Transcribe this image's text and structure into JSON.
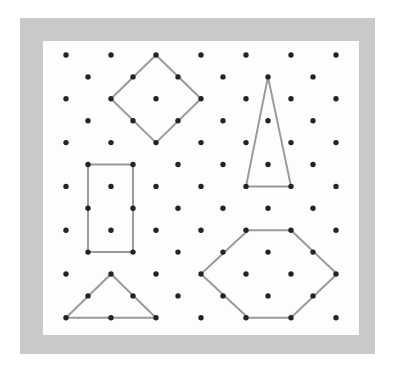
{
  "figure": {
    "kind": "geoboard-dot-grid",
    "canvas": {
      "width": 394,
      "height": 373,
      "background": "#ffffff"
    },
    "frame": {
      "name": "gray-border-frame",
      "x": 20,
      "y": 18,
      "width": 355,
      "height": 336,
      "color": "#c9c9c9"
    },
    "board": {
      "name": "white-dot-field",
      "x": 43,
      "y": 41,
      "width": 316,
      "height": 294,
      "color": "#fdfdfd"
    },
    "colors": {
      "dot": "#242424",
      "stroke": "#9a9a9a",
      "frame": "#c9c9c9",
      "board": "#fdfdfd",
      "page": "#ffffff"
    },
    "grid": {
      "pattern": "staggered-offset-rows",
      "row_count": 13,
      "odd_row_dot_count": 7,
      "even_row_dot_count": 6,
      "x_spacing": 45,
      "y_spacing": 21.9,
      "odd_row_x": [
        66,
        111,
        156,
        201,
        246,
        291,
        336
      ],
      "even_row_x": [
        88,
        133,
        178,
        223,
        268,
        313
      ],
      "row_y": [
        55,
        76.9,
        98.8,
        120.7,
        142.6,
        164.5,
        186.4,
        208.3,
        230.2,
        252.1,
        274,
        295.9,
        317.8
      ],
      "dot_radius": 2.7
    },
    "shapes": [
      {
        "name": "diamond-square",
        "label": "Diamond (rotated square)",
        "sides": 4,
        "closed": true,
        "points": [
          [
            156,
            55
          ],
          [
            201,
            98.8
          ],
          [
            156,
            142.6
          ],
          [
            111,
            98.8
          ]
        ]
      },
      {
        "name": "tall-isosceles-triangle",
        "label": "Tall narrow triangle",
        "sides": 3,
        "closed": true,
        "points": [
          [
            268,
            76.9
          ],
          [
            291,
            186.4
          ],
          [
            246,
            186.4
          ]
        ]
      },
      {
        "name": "vertical-rectangle",
        "label": "Vertical rectangle",
        "sides": 4,
        "closed": true,
        "points": [
          [
            88,
            164.5
          ],
          [
            133,
            164.5
          ],
          [
            133,
            252.1
          ],
          [
            88,
            252.1
          ]
        ]
      },
      {
        "name": "hexagon",
        "label": "Hexagon",
        "sides": 6,
        "closed": true,
        "points": [
          [
            248,
            230.2
          ],
          [
            291,
            230.2
          ],
          [
            337,
            274
          ],
          [
            291,
            317.8
          ],
          [
            248,
            317.8
          ],
          [
            201,
            274
          ]
        ]
      },
      {
        "name": "wide-isosceles-triangle",
        "label": "Wide triangle",
        "sides": 3,
        "closed": true,
        "points": [
          [
            111,
            274
          ],
          [
            156,
            317.8
          ],
          [
            66,
            317.8
          ]
        ]
      }
    ]
  },
  "chart_data": {
    "type": "scatter",
    "xlabel": "",
    "ylabel": "",
    "grid": false,
    "legend": "none",
    "xlim": [
      43,
      359
    ],
    "ylim": [
      41,
      335
    ],
    "note": "Dots form a staggered lattice; gray segments outline a diamond, a tall triangle, a rectangle, a hexagon and a wide triangle."
  }
}
